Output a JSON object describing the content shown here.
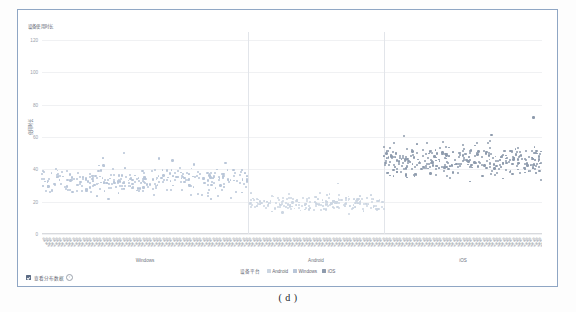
{
  "caption": "( d )",
  "chart_data": {
    "type": "scatter",
    "title": "设备使用时长",
    "ylabel": "使用时长",
    "xlabel": "",
    "ylim": [
      0,
      125
    ],
    "yticks": [
      0,
      20,
      40,
      60,
      80,
      100,
      120
    ],
    "ytick_labels": [
      "0",
      "20",
      "40",
      "60",
      "80",
      "100",
      "120"
    ],
    "grid": true,
    "legend_position": "bottom-center",
    "legend_title": "设备平台",
    "groups": [
      {
        "name": "Windows",
        "color": "#b9c6d8",
        "x_start": 0.0,
        "x_end": 0.412,
        "n_points": 300,
        "y_mean": 33,
        "y_spread": 17
      },
      {
        "name": "Android",
        "color": "#ccd6e2",
        "x_start": 0.412,
        "x_end": 0.684,
        "n_points": 200,
        "y_mean": 19,
        "y_spread": 12
      },
      {
        "name": "iOS",
        "color": "#8e9bad",
        "x_start": 0.684,
        "x_end": 1.0,
        "n_points": 320,
        "y_mean": 45,
        "y_spread": 20
      }
    ],
    "separators": [
      0.412,
      0.684
    ],
    "series": [
      {
        "name": "Android",
        "color": "#ccd6e2"
      },
      {
        "name": "Windows",
        "color": "#b9c6d8"
      },
      {
        "name": "iOS",
        "color": "#8e9bad"
      }
    ],
    "x_tick_sample": "设备编号",
    "x_tick_count": 150
  },
  "footer": {
    "checkbox_label": "查看分布数据",
    "info_icon": "info-icon",
    "checked": true
  }
}
